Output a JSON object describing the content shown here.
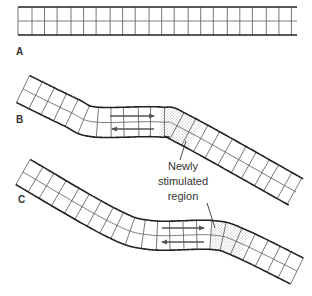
{
  "panels": [
    {
      "id": "A",
      "label": "A",
      "label_pos": [
        16,
        46
      ],
      "centerline": [
        [
          18,
          21
        ],
        [
          297,
          21
        ]
      ],
      "half_width": 14,
      "cell_len": 13,
      "dotted_range": null,
      "arrows": null
    },
    {
      "id": "B",
      "label": "B",
      "label_pos": [
        16,
        114
      ],
      "centerline": [
        [
          23,
          89
        ],
        [
          70,
          112
        ],
        [
          95,
          122
        ],
        [
          160,
          122
        ],
        [
          185,
          130
        ],
        [
          296,
          192
        ]
      ],
      "half_width": 15,
      "cell_len": 13.5,
      "dotted_range": [
        160,
        198
      ],
      "arrows": {
        "top": {
          "from": [
            110,
            116
          ],
          "to": [
            154,
            116
          ]
        },
        "bottom": {
          "from": [
            154,
            129
          ],
          "to": [
            112,
            129
          ]
        }
      }
    },
    {
      "id": "C",
      "label": "C",
      "label_pos": [
        18,
        194
      ],
      "centerline": [
        [
          23,
          172
        ],
        [
          110,
          222
        ],
        [
          150,
          235
        ],
        [
          212,
          235
        ],
        [
          240,
          243
        ],
        [
          297,
          271
        ]
      ],
      "half_width": 14.5,
      "cell_len": 13.5,
      "dotted_range": [
        212,
        245
      ],
      "arrows": {
        "top": {
          "from": [
            162,
            228
          ],
          "to": [
            204,
            228
          ]
        },
        "bottom": {
          "from": [
            204,
            242
          ],
          "to": [
            162,
            242
          ]
        }
      }
    }
  ],
  "annotation": {
    "lines": [
      "Newly",
      "stimulated",
      "region"
    ],
    "pos": [
      143,
      159
    ],
    "pointer_b": {
      "from": [
        180,
        160
      ],
      "to": [
        186,
        141
      ]
    },
    "pointer_c": {
      "from": [
        207,
        203
      ],
      "to": [
        215,
        228
      ]
    }
  },
  "colors": {
    "stroke": "#222222",
    "grid": "#555555",
    "arrow": "#555555",
    "dots": "#666666"
  }
}
